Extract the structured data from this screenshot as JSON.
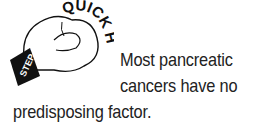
{
  "callout": {
    "icon": {
      "name": "boxing-glove-icon",
      "arc_label": "QUICK HIT",
      "cuff_label": "STEP-UP"
    },
    "text_lines": [
      "Most pancreatic",
      "cancers have no",
      "predisposing factor."
    ],
    "full_text": "Most pancreatic cancers have no predisposing factor."
  },
  "colors": {
    "text": "#222222",
    "icon_outline": "#111111",
    "background": "#ffffff"
  }
}
